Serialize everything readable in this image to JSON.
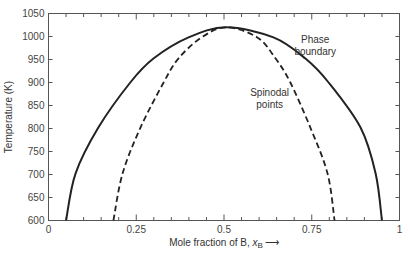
{
  "chart_data": {
    "type": "line",
    "title": "",
    "xlabel": "Mole fraction of B, x_B",
    "xlabel_main": "Mole fraction of B, ",
    "xlabel_var": "x",
    "xlabel_sub": "B",
    "xlabel_arrow": "⟶",
    "ylabel": "Temperature (K)",
    "xlim": [
      0,
      1
    ],
    "ylim": [
      600,
      1050
    ],
    "grid": false,
    "legend": "none",
    "x_ticks": [
      0,
      0.25,
      0.5,
      0.75,
      1
    ],
    "x_tick_labels": [
      "0",
      "0.25",
      "0.5",
      "0.75",
      "1"
    ],
    "x_minor_step": 0.05,
    "y_ticks": [
      600,
      650,
      700,
      750,
      800,
      850,
      900,
      950,
      1000,
      1050
    ],
    "y_tick_labels": [
      "600",
      "650",
      "700",
      "750",
      "800",
      "850",
      "900",
      "950",
      "1000",
      "1050"
    ],
    "annotations": [
      {
        "lines": [
          "Phase",
          "boundary"
        ],
        "x": 0.76,
        "y": 985
      },
      {
        "lines": [
          "Spinodal",
          "points"
        ],
        "x": 0.63,
        "y": 870
      }
    ],
    "series": [
      {
        "name": "Phase boundary",
        "style": "solid",
        "points": [
          [
            0.05,
            600
          ],
          [
            0.077,
            702
          ],
          [
            0.142,
            802
          ],
          [
            0.233,
            900
          ],
          [
            0.299,
            952
          ],
          [
            0.399,
            998
          ],
          [
            0.507,
            1020
          ],
          [
            0.641,
            998
          ],
          [
            0.732,
            952
          ],
          [
            0.798,
            900
          ],
          [
            0.889,
            802
          ],
          [
            0.932,
            702
          ],
          [
            0.95,
            600
          ]
        ]
      },
      {
        "name": "Spinodal points",
        "style": "dashed",
        "points": [
          [
            0.185,
            600
          ],
          [
            0.211,
            702
          ],
          [
            0.262,
            802
          ],
          [
            0.328,
            900
          ],
          [
            0.37,
            952
          ],
          [
            0.436,
            998
          ],
          [
            0.507,
            1020
          ],
          [
            0.595,
            998
          ],
          [
            0.647,
            952
          ],
          [
            0.689,
            900
          ],
          [
            0.746,
            802
          ],
          [
            0.795,
            702
          ],
          [
            0.815,
            600
          ]
        ]
      }
    ]
  }
}
